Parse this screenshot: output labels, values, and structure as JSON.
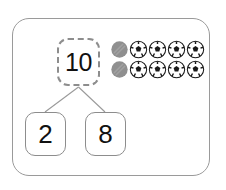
{
  "worksheet": {
    "type": "number-bond",
    "title_text": "",
    "frame": {
      "border_color": "#9a9a9a",
      "background": "#ffffff"
    },
    "number_bond": {
      "total": {
        "value": "10",
        "style": "dashed",
        "border_color": "#8d8d8d"
      },
      "parts": [
        {
          "value": "2",
          "style": "solid",
          "border_color": "#8d8d8d"
        },
        {
          "value": "8",
          "style": "solid",
          "border_color": "#8d8d8d"
        }
      ],
      "connector_color": "#9a9a9a"
    },
    "counters": {
      "total_count": 10,
      "columns": 5,
      "rows": 2,
      "shaded_count": 2,
      "ball_count": 8,
      "shaded_color": "#8f8f8f",
      "ball_fill": "#ffffff",
      "ball_pattern_color": "#1a1a1a",
      "items": [
        [
          {
            "kind": "shaded-circle-counter"
          },
          {
            "kind": "soccer-ball-counter"
          },
          {
            "kind": "soccer-ball-counter"
          },
          {
            "kind": "soccer-ball-counter"
          },
          {
            "kind": "soccer-ball-counter"
          }
        ],
        [
          {
            "kind": "shaded-circle-counter"
          },
          {
            "kind": "soccer-ball-counter"
          },
          {
            "kind": "soccer-ball-counter"
          },
          {
            "kind": "soccer-ball-counter"
          },
          {
            "kind": "soccer-ball-counter"
          }
        ]
      ]
    }
  }
}
